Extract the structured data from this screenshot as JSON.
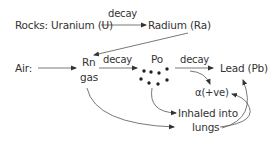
{
  "diagram": {
    "nodes": {
      "rocks_uranium": "Rocks: Uranium (U)",
      "radium": "Radium (Ra)",
      "air": "Air:",
      "rn": "Rn",
      "rn_gas": "gas",
      "po": "Po",
      "lead": "Lead (Pb)",
      "alpha": "α(+ve)",
      "inhaled_line1": "Inhaled into",
      "inhaled_line2": "lungs"
    },
    "edge_labels": {
      "u_to_ra": "decay",
      "rn_to_po": "decay",
      "po_to_pb": "decay"
    },
    "edges": [
      {
        "from": "Uranium (U)",
        "to": "Radium (Ra)",
        "label": "decay"
      },
      {
        "from": "Radium (Ra)",
        "to": "Rn gas"
      },
      {
        "from": "Air",
        "to": "Rn gas"
      },
      {
        "from": "Rn gas",
        "to": "Po",
        "label": "decay"
      },
      {
        "from": "Po",
        "to": "Lead (Pb)",
        "label": "decay"
      },
      {
        "from": "Po",
        "to": "α(+ve)"
      },
      {
        "from": "Po",
        "to": "Inhaled into lungs"
      },
      {
        "from": "Rn gas",
        "to": "Inhaled into lungs"
      },
      {
        "from": "Inhaled into lungs",
        "to": "α(+ve)"
      },
      {
        "from": "Inhaled into lungs",
        "to": "Lead (Pb)"
      }
    ],
    "colors": {
      "text": "#333333",
      "line": "#444444"
    }
  }
}
